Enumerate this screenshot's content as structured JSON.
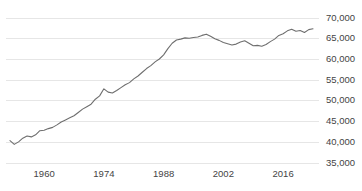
{
  "chart_data": {
    "type": "line",
    "title": "",
    "subtitle": "",
    "xlabel": "",
    "ylabel": "",
    "xlim": [
      1952,
      2023
    ],
    "ylim": [
      35000,
      70000
    ],
    "grid": true,
    "legend": null,
    "legend_position": "none",
    "line_color": "#6e6e6e",
    "grid_color": "#e6e6e6",
    "background_color": "#ffffff",
    "tick_label_color": "#444444",
    "yticks": [
      70000,
      65000,
      60000,
      55000,
      50000,
      45000,
      40000,
      35000
    ],
    "ytick_labels": [
      "70,000",
      "65,000",
      "60,000",
      "55,000",
      "50,000",
      "45,000",
      "40,000",
      "35,000"
    ],
    "xticks": [
      1960,
      1974,
      1988,
      2002,
      2016
    ],
    "xtick_labels": [
      "1960",
      "1974",
      "1988",
      "2002",
      "2016"
    ],
    "series": [
      {
        "name": "value",
        "x": [
          1952,
          1953,
          1954,
          1955,
          1956,
          1957,
          1958,
          1959,
          1960,
          1961,
          1962,
          1963,
          1964,
          1965,
          1966,
          1967,
          1968,
          1969,
          1970,
          1971,
          1972,
          1973,
          1974,
          1975,
          1976,
          1977,
          1978,
          1979,
          1980,
          1981,
          1982,
          1983,
          1984,
          1985,
          1986,
          1987,
          1988,
          1989,
          1990,
          1991,
          1992,
          1993,
          1994,
          1995,
          1996,
          1997,
          1998,
          1999,
          2000,
          2001,
          2002,
          2003,
          2004,
          2005,
          2006,
          2007,
          2008,
          2009,
          2010,
          2011,
          2012,
          2013,
          2014,
          2015,
          2016,
          2017,
          2018,
          2019,
          2020,
          2021,
          2022,
          2023
        ],
        "values": [
          40400,
          39500,
          40100,
          41000,
          41500,
          41300,
          41800,
          42800,
          42900,
          43300,
          43600,
          44200,
          44900,
          45400,
          45900,
          46400,
          47200,
          48000,
          48600,
          49200,
          50400,
          51200,
          52900,
          52100,
          51900,
          52500,
          53200,
          53900,
          54400,
          55300,
          56000,
          56900,
          57800,
          58500,
          59400,
          60100,
          61100,
          62600,
          63900,
          64700,
          64900,
          65200,
          65100,
          65300,
          65400,
          65800,
          66100,
          65600,
          65000,
          64600,
          64100,
          63800,
          63500,
          63700,
          64200,
          64500,
          63900,
          63300,
          63400,
          63200,
          63600,
          64300,
          64900,
          65800,
          66200,
          66900,
          67300,
          66800,
          67000,
          66500,
          67200,
          67400
        ]
      }
    ]
  }
}
